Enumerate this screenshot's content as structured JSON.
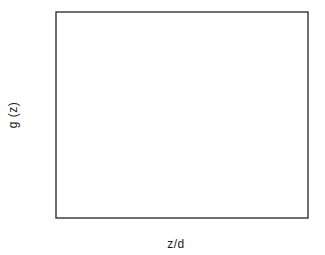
{
  "chart_data": {
    "type": "line",
    "title": "",
    "xlabel": "z/d",
    "ylabel": "g (z)",
    "xlim": [
      0.5,
      4.0
    ],
    "ylim": [
      0.4,
      1.02
    ],
    "grid": false,
    "legend": "none",
    "x_ticks_major": [
      0.5,
      1.5,
      2.5,
      3.5
    ],
    "x_ticks_major_labels": [
      "0.5",
      "1.5",
      "2.5",
      "3.5"
    ],
    "x_ticks_minor": [
      1.0,
      2.0,
      3.0
    ],
    "y_ticks_major": [
      0.4,
      0.6,
      0.8,
      1.0
    ],
    "y_ticks_major_labels": [
      "0.4",
      "0.6",
      "0.8",
      "1.0"
    ],
    "y_ticks_minor": [
      0.5,
      0.7,
      0.9
    ],
    "series": [
      {
        "name": "data points",
        "style": "scatter",
        "marker": "filled-circle",
        "color": "#000000",
        "x": [
          0.53,
          0.8,
          1.0,
          1.22,
          1.45,
          1.63,
          1.8,
          2.05,
          2.25,
          2.45,
          2.58,
          2.78,
          3.0,
          3.85
        ],
        "y": [
          0.597,
          0.672,
          0.745,
          0.83,
          0.836,
          0.877,
          0.898,
          0.92,
          0.925,
          0.938,
          0.922,
          0.96,
          0.963,
          0.988
        ]
      },
      {
        "name": "solid curve",
        "style": "solid",
        "color": "#000000",
        "x": [
          0.5,
          0.55,
          0.6,
          0.7,
          0.8,
          0.9,
          1.0,
          1.1,
          1.2,
          1.3,
          1.4,
          1.5,
          1.6,
          1.7,
          1.8,
          2.0,
          2.2,
          2.4,
          2.6,
          2.8,
          3.0,
          3.2,
          3.4,
          3.6,
          3.8,
          4.0
        ],
        "y": [
          0.463,
          0.52,
          0.565,
          0.633,
          0.683,
          0.722,
          0.754,
          0.782,
          0.806,
          0.826,
          0.843,
          0.858,
          0.871,
          0.882,
          0.892,
          0.909,
          0.922,
          0.933,
          0.943,
          0.952,
          0.96,
          0.967,
          0.973,
          0.979,
          0.984,
          0.989
        ]
      },
      {
        "name": "dashed curve",
        "style": "dashed",
        "color": "#000000",
        "x": [
          0.5,
          0.55,
          0.6,
          0.7,
          0.8,
          0.9,
          1.0,
          1.1,
          1.2,
          1.3,
          1.4,
          1.5,
          1.6,
          1.7,
          1.8,
          2.0,
          2.2,
          2.4,
          2.6,
          2.8,
          3.0,
          3.2,
          3.4,
          3.6,
          3.8,
          4.0
        ],
        "y": [
          0.54,
          0.588,
          0.627,
          0.687,
          0.731,
          0.766,
          0.794,
          0.818,
          0.838,
          0.855,
          0.869,
          0.881,
          0.892,
          0.901,
          0.91,
          0.924,
          0.936,
          0.946,
          0.954,
          0.962,
          0.968,
          0.974,
          0.979,
          0.984,
          0.989,
          0.993
        ]
      },
      {
        "name": "dotted curve",
        "style": "dotted",
        "color": "#000000",
        "x": [
          0.5,
          0.55,
          0.6,
          0.7,
          0.8,
          0.9,
          1.0,
          1.1,
          1.2,
          1.3,
          1.4,
          1.5,
          1.6,
          1.7,
          1.8,
          2.0,
          2.2,
          2.4,
          2.6,
          2.8,
          3.0,
          3.2,
          3.4,
          3.6,
          3.8,
          4.0
        ],
        "y": [
          0.603,
          0.65,
          0.69,
          0.752,
          0.797,
          0.831,
          0.857,
          0.877,
          0.893,
          0.906,
          0.917,
          0.926,
          0.933,
          0.94,
          0.945,
          0.955,
          0.962,
          0.968,
          0.973,
          0.977,
          0.98,
          0.983,
          0.986,
          0.988,
          0.99,
          0.992
        ]
      }
    ]
  },
  "axes": {
    "x_title": "z/d",
    "y_title": "g (z)"
  }
}
